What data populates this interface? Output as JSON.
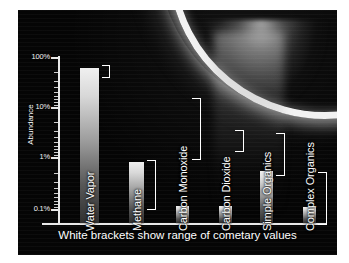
{
  "figure": {
    "caption": "White brackets show range of cometary values",
    "background_description": "enceladus-limb-plume",
    "colors": {
      "panel_background": "#050505",
      "axis": "#e8e8e8",
      "text": "#ffffff",
      "bracket": "#ffffff",
      "page_background": "#ffffff"
    }
  },
  "chart_data": {
    "type": "bar",
    "title": "",
    "xlabel": "",
    "ylabel": "Abundance",
    "yscale": "log",
    "ylim": [
      0.07,
      130
    ],
    "grid": false,
    "legend": null,
    "ytick_labels": [
      "100%",
      "10%",
      "1%",
      "0.1%"
    ],
    "ytick_values": [
      100,
      10,
      1,
      0.1
    ],
    "categories": [
      "Water Vapor",
      "Methane",
      "Carbon Monoxide",
      "Carbon Dioxide",
      "Simple Organics",
      "Complex Organics"
    ],
    "values": [
      100,
      1.1,
      0.13,
      0.13,
      0.9,
      0.12
    ],
    "value_unit": "percent",
    "annotations": "White brackets show range of cometary values",
    "bracket_ranges": [
      {
        "category": "Water Vapor",
        "low": 88,
        "high": 100
      },
      {
        "category": "Methane",
        "low": 0.3,
        "high": 1.3
      },
      {
        "category": "Carbon Monoxide",
        "low": 3.5,
        "high": 33
      },
      {
        "category": "Carbon Dioxide",
        "low": 2.6,
        "high": 6.5
      },
      {
        "category": "Simple Organics",
        "low": 1.4,
        "high": 6.0
      },
      {
        "category": "Complex Organics",
        "low": 0.1,
        "high": 1.9
      }
    ]
  },
  "bars_px": [
    {
      "label": "Water Vapor",
      "x": 62,
      "w": 19,
      "top": 58
    },
    {
      "label": "Methane",
      "x": 111,
      "w": 15,
      "top": 152
    },
    {
      "label": "Carbon Monoxide",
      "x": 158,
      "w": 13,
      "top": 196
    },
    {
      "label": "Carbon Dioxide",
      "x": 201,
      "w": 13,
      "top": 196
    },
    {
      "label": "Simple Organics",
      "x": 242,
      "w": 13,
      "top": 161
    },
    {
      "label": "Complex Organics",
      "x": 285,
      "w": 13,
      "top": 197
    }
  ],
  "brackets_px": [
    {
      "label": "Water Vapor",
      "x": 84,
      "top": 55,
      "bottom": 66,
      "w": 7
    },
    {
      "label": "Methane",
      "x": 129,
      "top": 150,
      "bottom": 198,
      "w": 8
    },
    {
      "label": "Carbon Monoxide",
      "x": 174,
      "top": 88,
      "bottom": 148,
      "w": 8
    },
    {
      "label": "Carbon Dioxide",
      "x": 217,
      "top": 120,
      "bottom": 140,
      "w": 8
    },
    {
      "label": "Simple Organics",
      "x": 258,
      "top": 123,
      "bottom": 164,
      "w": 8
    },
    {
      "label": "Complex Organics",
      "x": 300,
      "top": 162,
      "bottom": 213,
      "w": 8
    }
  ],
  "axis_px": {
    "baseline_y": 213,
    "majors": [
      {
        "label": "100%",
        "y": 47
      },
      {
        "label": "10%",
        "y": 97
      },
      {
        "label": "1%",
        "y": 147
      },
      {
        "label": "0.1%",
        "y": 199
      }
    ]
  }
}
